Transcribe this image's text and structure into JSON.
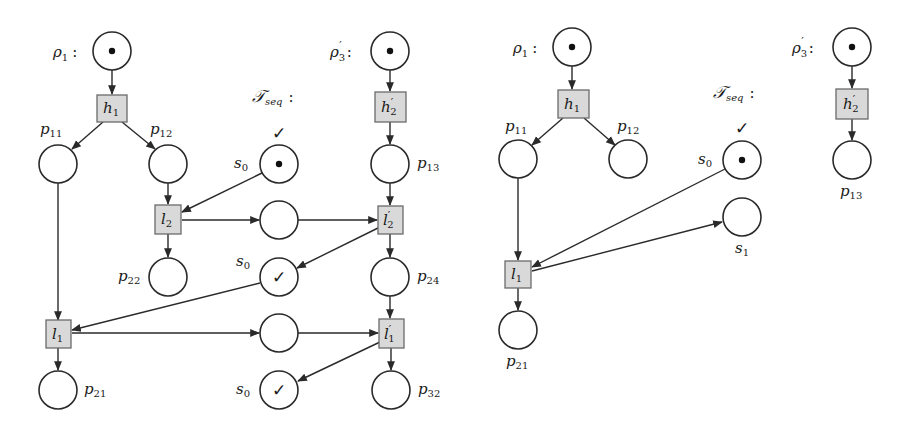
{
  "diagrams": [
    {
      "id": "left",
      "groups": {
        "rho1": "ρ₁ :",
        "rho3": "ρ′₃ :",
        "tseq": "𝒯",
        "tseq_sub": "seq",
        "tseq_colon": ":"
      },
      "places": [
        {
          "id": "rho1",
          "label": "",
          "token": "dot"
        },
        {
          "id": "p11",
          "label": "p",
          "sub": "11",
          "token": ""
        },
        {
          "id": "p12",
          "label": "p",
          "sub": "12",
          "token": ""
        },
        {
          "id": "s0_top",
          "label": "s",
          "sub": "0",
          "token": "dot",
          "above": "✓"
        },
        {
          "id": "rho3",
          "label": "",
          "token": "dot"
        },
        {
          "id": "p13",
          "label": "p",
          "sub": "13",
          "token": ""
        },
        {
          "id": "mid1",
          "label": "",
          "token": ""
        },
        {
          "id": "p22",
          "label": "p",
          "sub": "22",
          "token": ""
        },
        {
          "id": "s0_mid",
          "label": "s",
          "sub": "0",
          "token": "✓"
        },
        {
          "id": "p24",
          "label": "p",
          "sub": "24",
          "token": ""
        },
        {
          "id": "mid2",
          "label": "",
          "token": ""
        },
        {
          "id": "p21",
          "label": "p",
          "sub": "21",
          "token": ""
        },
        {
          "id": "s0_bot",
          "label": "s",
          "sub": "0",
          "token": "✓"
        },
        {
          "id": "p32",
          "label": "p",
          "sub": "32",
          "token": ""
        }
      ],
      "transitions": [
        {
          "id": "h1",
          "label": "h",
          "sub": "1",
          "prime": false
        },
        {
          "id": "h2p",
          "label": "h",
          "sub": "2",
          "prime": true
        },
        {
          "id": "l2",
          "label": "l",
          "sub": "2",
          "prime": false
        },
        {
          "id": "l2p",
          "label": "l",
          "sub": "2",
          "prime": true
        },
        {
          "id": "l1",
          "label": "l",
          "sub": "1",
          "prime": false
        },
        {
          "id": "l1p",
          "label": "l",
          "sub": "1",
          "prime": true
        }
      ]
    },
    {
      "id": "right",
      "groups": {
        "rho1": "ρ₁ :",
        "rho3": "ρ′₃ :",
        "tseq": "𝒯",
        "tseq_sub": "seq",
        "tseq_colon": ":"
      },
      "places": [
        {
          "id": "rho1",
          "label": "",
          "token": "dot"
        },
        {
          "id": "p11",
          "label": "p",
          "sub": "11",
          "token": ""
        },
        {
          "id": "p12",
          "label": "p",
          "sub": "12",
          "token": ""
        },
        {
          "id": "s0",
          "label": "s",
          "sub": "0",
          "token": "dot",
          "above": "✓"
        },
        {
          "id": "rho3",
          "label": "",
          "token": "dot"
        },
        {
          "id": "p13",
          "label": "p",
          "sub": "13",
          "token": ""
        },
        {
          "id": "s1",
          "label": "s",
          "sub": "1",
          "token": ""
        },
        {
          "id": "p21",
          "label": "p",
          "sub": "21",
          "token": ""
        }
      ],
      "transitions": [
        {
          "id": "h1",
          "label": "h",
          "sub": "1",
          "prime": false
        },
        {
          "id": "h2p",
          "label": "h",
          "sub": "2",
          "prime": true
        },
        {
          "id": "l1",
          "label": "l",
          "sub": "1",
          "prime": false
        }
      ]
    }
  ],
  "text": {
    "rho": "ρ",
    "one": "1",
    "three": "3",
    "prime": "′",
    "colon": ":",
    "check": "✓",
    "tseq_T": "𝒯",
    "tseq_sub": "seq",
    "p": "p",
    "s": "s",
    "h": "h",
    "l": "l",
    "n11": "11",
    "n12": "12",
    "n13": "13",
    "n21": "21",
    "n22": "22",
    "n24": "24",
    "n32": "32",
    "n0": "0",
    "n1": "1",
    "n2": "2"
  }
}
